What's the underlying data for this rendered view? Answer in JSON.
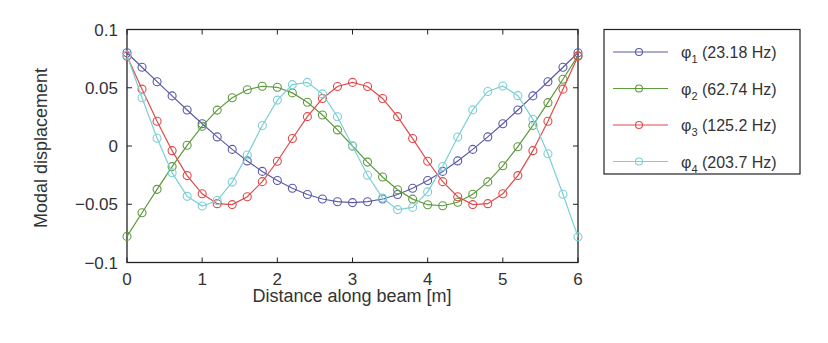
{
  "chart_data": {
    "type": "line",
    "title": "",
    "xlabel": "Distance along beam [m]",
    "ylabel": "Modal displacement",
    "xlim": [
      0,
      6
    ],
    "ylim": [
      -0.1,
      0.1
    ],
    "xticks": [
      0,
      1,
      2,
      3,
      4,
      5,
      6
    ],
    "xtick_labels": [
      "0",
      "1",
      "2",
      "3",
      "4",
      "5",
      "6"
    ],
    "yticks": [
      0.1,
      0.05,
      0,
      -0.05,
      -0.1
    ],
    "ytick_labels": [
      "0.1",
      "0.05",
      "0",
      "−0.05",
      "−0.1"
    ],
    "grid": false,
    "legend_position": "outside-right-top",
    "marker": "circle",
    "x": [
      0,
      0.2,
      0.4,
      0.6,
      0.8,
      1.0,
      1.2,
      1.4,
      1.6,
      1.8,
      2.0,
      2.2,
      2.4,
      2.6,
      2.8,
      3.0,
      3.2,
      3.4,
      3.6,
      3.8,
      4.0,
      4.2,
      4.4,
      4.6,
      4.8,
      5.0,
      5.2,
      5.4,
      5.6,
      5.8,
      6.0
    ],
    "series": [
      {
        "name": "φ₁ (23.18 Hz)",
        "symbol": "φ",
        "subscript": "1",
        "freq_label": "(23.18 Hz)",
        "color": "#5a5aa8",
        "values": [
          0.08,
          0.0676,
          0.0552,
          0.043,
          0.0309,
          0.0191,
          0.0078,
          -0.0029,
          -0.0128,
          -0.0218,
          -0.0296,
          -0.0363,
          -0.0416,
          -0.0455,
          -0.0478,
          -0.0486,
          -0.0478,
          -0.0455,
          -0.0416,
          -0.0363,
          -0.0296,
          -0.0218,
          -0.0128,
          -0.0029,
          0.0078,
          0.0191,
          0.0309,
          0.043,
          0.0552,
          0.0676,
          0.08
        ]
      },
      {
        "name": "φ₂ (62.74 Hz)",
        "symbol": "φ",
        "subscript": "2",
        "freq_label": "(62.74 Hz)",
        "color": "#5e9a3e",
        "values": [
          -0.0776,
          -0.0573,
          -0.0372,
          -0.0177,
          0.0006,
          0.017,
          0.0308,
          0.0414,
          0.0483,
          0.0513,
          0.0504,
          0.0456,
          0.0375,
          0.0266,
          0.0138,
          0.0,
          -0.0138,
          -0.0266,
          -0.0375,
          -0.0456,
          -0.0504,
          -0.0513,
          -0.0483,
          -0.0414,
          -0.0308,
          -0.017,
          -0.0006,
          0.0177,
          0.0372,
          0.0573,
          0.0776
        ]
      },
      {
        "name": "φ₃ (125.2 Hz)",
        "symbol": "φ",
        "subscript": "3",
        "freq_label": "(125.2 Hz)",
        "color": "#e04a4a",
        "values": [
          0.077,
          0.0488,
          0.0213,
          -0.004,
          -0.0254,
          -0.041,
          -0.0495,
          -0.0503,
          -0.0436,
          -0.0306,
          -0.0131,
          0.0064,
          0.0252,
          0.0408,
          0.0511,
          0.0546,
          0.0511,
          0.0408,
          0.0252,
          0.0064,
          -0.0131,
          -0.0306,
          -0.0436,
          -0.0503,
          -0.0495,
          -0.041,
          -0.0254,
          -0.004,
          0.0213,
          0.0488,
          0.077
        ]
      },
      {
        "name": "φ₄ (203.7 Hz)",
        "symbol": "φ",
        "subscript": "4",
        "freq_label": "(203.7 Hz)",
        "color": "#7ccfd4",
        "values": [
          0.078,
          0.0414,
          0.0066,
          -0.0229,
          -0.0432,
          -0.0515,
          -0.0468,
          -0.031,
          -0.0077,
          0.0176,
          0.0394,
          0.0527,
          0.0546,
          0.0447,
          0.0251,
          0.0,
          -0.0251,
          -0.0447,
          -0.0546,
          -0.0527,
          -0.0394,
          -0.0176,
          0.0077,
          0.031,
          0.0468,
          0.0515,
          0.0432,
          0.0229,
          -0.0066,
          -0.0414,
          -0.078
        ]
      }
    ]
  },
  "layout": {
    "plot_left": 127,
    "plot_right": 578,
    "plot_top": 29.5,
    "plot_bottom": 262.5
  }
}
